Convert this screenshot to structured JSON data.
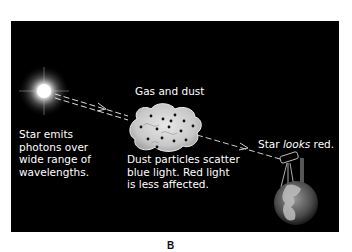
{
  "diagram": {
    "caption": "B",
    "labels": {
      "star": [
        "Star emits",
        "photons over",
        "wide range of",
        "wavelengths."
      ],
      "cloud_title": "Gas and dust",
      "cloud_note": [
        "Dust particles scatter",
        "blue light. Red light",
        "is less affected."
      ],
      "observer_prefix": "Star ",
      "observer_emphasis": "looks",
      "observer_suffix": " red."
    },
    "elements": [
      "star",
      "light-path",
      "gas-dust-cloud",
      "telescope",
      "earth"
    ],
    "colors": {
      "background": "#000000",
      "text": "#ffffff",
      "cloud": "#d8d8d8",
      "dust": "#111111"
    }
  }
}
